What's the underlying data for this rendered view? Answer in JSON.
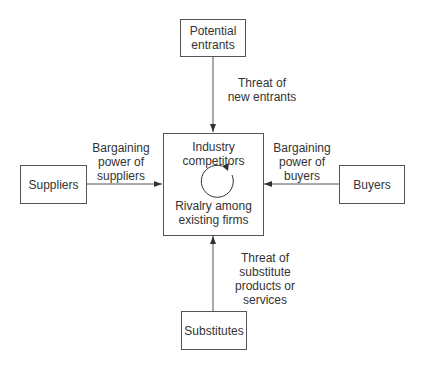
{
  "diagram": {
    "nodes": {
      "potential_entrants": {
        "line1": "Potential",
        "line2": "entrants"
      },
      "industry": {
        "line1": "Industry",
        "line2": "competitors",
        "line3": "Rivalry among",
        "line4": "existing firms"
      },
      "suppliers": {
        "label": "Suppliers"
      },
      "buyers": {
        "label": "Buyers"
      },
      "substitutes": {
        "label": "Substitutes"
      }
    },
    "edges": {
      "entrants": {
        "line1": "Threat of",
        "line2": "new entrants"
      },
      "suppliers": {
        "line1": "Bargaining",
        "line2": "power of",
        "line3": "suppliers"
      },
      "buyers": {
        "line1": "Bargaining",
        "line2": "power of",
        "line3": "buyers"
      },
      "substitutes": {
        "line1": "Threat of",
        "line2": "substitute",
        "line3": "products or",
        "line4": "services"
      }
    },
    "colors": {
      "line": "#555555",
      "text": "#333333"
    }
  }
}
